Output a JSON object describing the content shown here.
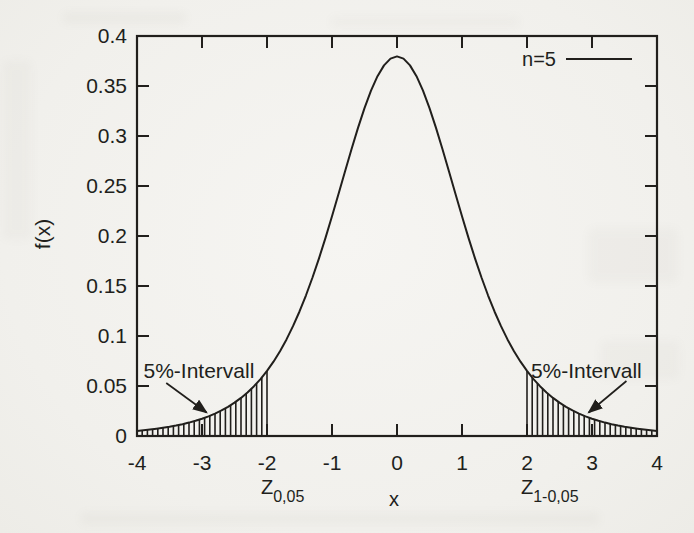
{
  "page": {
    "background_color": "#f2f1ed",
    "ink_color": "#211f1c"
  },
  "chart_data": {
    "type": "line",
    "title": "",
    "xlabel": "x",
    "ylabel": "f(x)",
    "xlim": [
      -4,
      4
    ],
    "ylim": [
      0,
      0.4
    ],
    "grid": false,
    "tick_style": "inward-mirrored",
    "xticks": {
      "values": [
        -4,
        -3,
        -2,
        -1,
        0,
        1,
        2,
        3,
        4
      ],
      "labels": [
        "-4",
        "-3",
        "-2",
        "-1",
        "0",
        "1",
        "2",
        "3",
        "4"
      ]
    },
    "yticks": {
      "values": [
        0,
        0.05,
        0.1,
        0.15,
        0.2,
        0.25,
        0.3,
        0.35,
        0.4
      ],
      "labels": [
        "0",
        "0.05",
        "0.1",
        "0.15",
        "0.2",
        "0.25",
        "0.3",
        "0.35",
        "0.4"
      ]
    },
    "legend": {
      "position": "top-right",
      "entries": [
        {
          "label": "n=5",
          "style": "solid-line"
        }
      ]
    },
    "series": [
      {
        "name": "n=5",
        "x_min": -4,
        "x_max": 4,
        "x_step": 0.1,
        "y": [
          0.00512,
          0.00575,
          0.00646,
          0.00727,
          0.00819,
          0.00924,
          0.01045,
          0.01183,
          0.01341,
          0.01522,
          0.01729,
          0.01968,
          0.02242,
          0.02556,
          0.02918,
          0.03333,
          0.03809,
          0.04355,
          0.0498,
          0.05695,
          0.06509,
          0.07434,
          0.08482,
          0.0966,
          0.10982,
          0.12452,
          0.14074,
          0.15848,
          0.17766,
          0.19814,
          0.21968,
          0.24195,
          0.26449,
          0.28676,
          0.30814,
          0.32792,
          0.34538,
          0.35983,
          0.37064,
          0.37734,
          0.37961,
          0.37734,
          0.37064,
          0.35983,
          0.34538,
          0.32792,
          0.30814,
          0.28676,
          0.26449,
          0.24195,
          0.21968,
          0.19814,
          0.17766,
          0.15848,
          0.14074,
          0.12452,
          0.10982,
          0.0966,
          0.08482,
          0.07434,
          0.06509,
          0.05695,
          0.0498,
          0.04355,
          0.03809,
          0.03333,
          0.02918,
          0.02556,
          0.02242,
          0.01968,
          0.01729,
          0.01522,
          0.01341,
          0.01183,
          0.01045,
          0.00924,
          0.00819,
          0.00727,
          0.00646,
          0.00575,
          0.00512
        ]
      }
    ],
    "shaded_regions": [
      {
        "x_from": -4,
        "x_to": -2,
        "style": "vertical-hatch",
        "label": "5%-Intervall"
      },
      {
        "x_from": 2,
        "x_to": 4,
        "style": "vertical-hatch",
        "label": "5%-Intervall"
      }
    ],
    "annotations": [
      {
        "text": "5%-Intervall",
        "text_x": -3.9,
        "text_y": 0.058,
        "arrow_from": [
          -3.55,
          0.053
        ],
        "arrow_to": [
          -2.93,
          0.0235
        ]
      },
      {
        "text": "5%-Intervall",
        "text_x": 2.06,
        "text_y": 0.058,
        "arrow_from": [
          3.53,
          0.055
        ],
        "arrow_to": [
          2.95,
          0.0235
        ]
      }
    ],
    "x_axis_extra_labels": [
      {
        "main": "Z",
        "sub": "0,05",
        "at_x": -2
      },
      {
        "main": "Z",
        "sub": "1-0,05",
        "at_x": 2
      }
    ]
  }
}
